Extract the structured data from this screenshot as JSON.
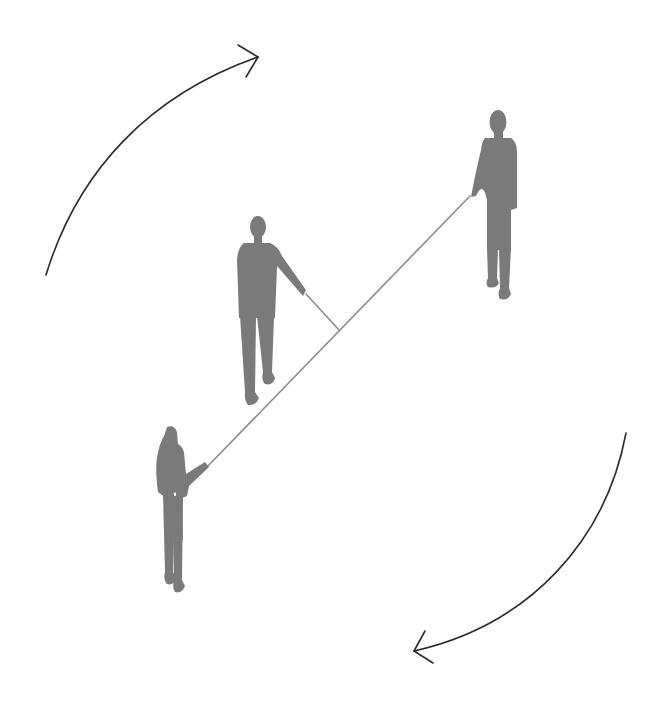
{
  "diagram": {
    "colors": {
      "background": "#ffffff",
      "figure": "#7a7a7a",
      "rope": "#8c8c8c",
      "arrow": "#2a2a2a"
    },
    "figures": [
      {
        "id": "person-left",
        "role": "rope end holder"
      },
      {
        "id": "person-middle",
        "role": "holds rope at middle point"
      },
      {
        "id": "person-right",
        "role": "rope end holder"
      }
    ],
    "arrows": [
      {
        "id": "arrow-top-left",
        "direction": "clockwise",
        "head": "top-right"
      },
      {
        "id": "arrow-bottom-right",
        "direction": "clockwise",
        "head": "bottom-left"
      }
    ]
  }
}
